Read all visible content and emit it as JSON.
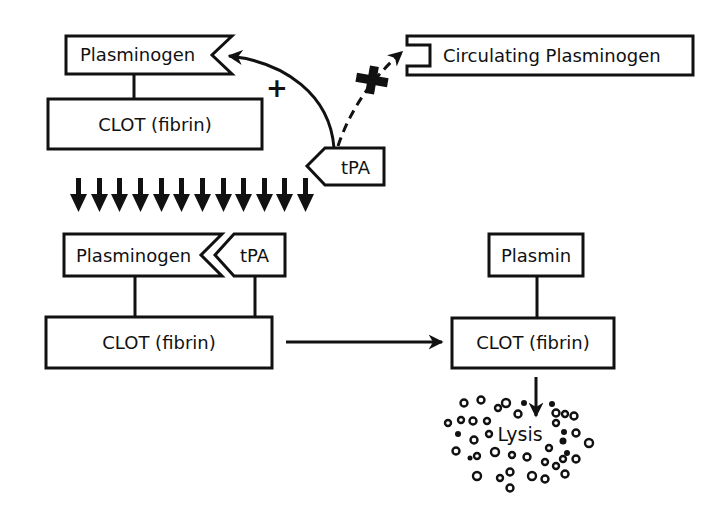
{
  "colors": {
    "ink": "#111111",
    "background": "#ffffff"
  },
  "top": {
    "plasminogen_bound": {
      "label": "Plasminogen"
    },
    "clot": {
      "label": "CLOT (fibrin)"
    },
    "tpa": {
      "label": "tPA"
    },
    "circulating": {
      "label": "Circulating Plasminogen"
    },
    "promotes_sign": "+",
    "blocked_sign": "+",
    "transition_arrow_count": 12
  },
  "bottom_left": {
    "plasminogen": {
      "label": "Plasminogen"
    },
    "tpa": {
      "label": "tPA"
    },
    "clot": {
      "label": "CLOT (fibrin)"
    }
  },
  "bottom_right": {
    "plasmin": {
      "label": "Plasmin"
    },
    "clot": {
      "label": "CLOT (fibrin)"
    },
    "lysis": {
      "label": "Lysis"
    }
  }
}
